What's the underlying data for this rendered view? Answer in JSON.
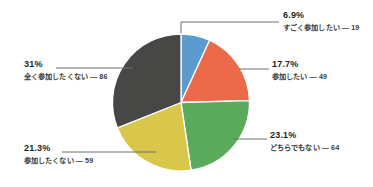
{
  "chart_data": {
    "type": "pie",
    "title": "",
    "xlabel": "",
    "ylabel": "",
    "total": 277,
    "legend_position": "callout-labels",
    "grid": false,
    "start_angle_deg": 0,
    "direction": "clockwise",
    "categories": [
      "すごく参加したい",
      "参加したい",
      "どちらでもない",
      "参加したくない",
      "全く参加したくない"
    ],
    "values": [
      19,
      49,
      64,
      59,
      86
    ],
    "percent_labels": [
      "6.9%",
      "17.7%",
      "23.1%",
      "21.3%",
      "31%"
    ],
    "percents": [
      6.9,
      17.7,
      23.1,
      21.3,
      31.0
    ],
    "colors": [
      "#5b9bd0",
      "#ec6a4a",
      "#5caa5b",
      "#d8c74b",
      "#474745"
    ],
    "slices": [
      {
        "label": "すごく参加したい",
        "value": 19,
        "count_text": "19",
        "percent_text": "6.9%",
        "color": "#5b9bd0",
        "dash": "―"
      },
      {
        "label": "参加したい",
        "value": 49,
        "count_text": "49",
        "percent_text": "17.7%",
        "color": "#ec6a4a",
        "dash": "―"
      },
      {
        "label": "どちらでもない",
        "value": 64,
        "count_text": "64",
        "percent_text": "23.1%",
        "color": "#5caa5b",
        "dash": "―"
      },
      {
        "label": "参加したくない",
        "value": 59,
        "count_text": "59",
        "percent_text": "21.3%",
        "color": "#d8c74b",
        "dash": "―"
      },
      {
        "label": "全く参加したくない",
        "value": 86,
        "count_text": "86",
        "percent_text": "31%",
        "color": "#474745",
        "dash": "―"
      }
    ]
  },
  "canvas": {
    "background": "#ffffff",
    "leader_color": "#6e6e6c",
    "text_color": "#231f20"
  }
}
